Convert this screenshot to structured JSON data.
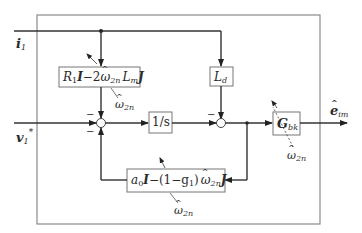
{
  "diagram": {
    "type": "control-block-diagram",
    "inputs": {
      "i1": {
        "symbol": "i",
        "sub": "1"
      },
      "v1star": {
        "symbol": "v",
        "sub": "1",
        "sup": "*"
      }
    },
    "output": {
      "symbol": "e",
      "sub": "im",
      "hat": true
    },
    "blocks": {
      "r1_block": {
        "parts": [
          "R",
          "1",
          "I",
          "−2",
          "ω",
          "2n",
          "L",
          "m",
          "J"
        ],
        "text": "R1I − 2ω̂2n Lm J"
      },
      "ld_block": {
        "symbol": "L",
        "sub": "d",
        "text": "Ld"
      },
      "integrator": {
        "text": "1/s"
      },
      "gbk_block": {
        "symbol": "G",
        "sub": "bk",
        "text": "Gbk"
      },
      "feedback_block": {
        "text": "a0I − (1 − g1) ω̂2n J",
        "a": "a",
        "a_sub": "0",
        "I": "I",
        "mid": "−(1−g",
        "g_sub": "1",
        "close": ")",
        "w": "ω",
        "w_sub": "2n",
        "J": "J"
      }
    },
    "parameter_labels": {
      "omega": "ω",
      "omega_sub": "2n"
    },
    "summing_signs": {
      "sum1_top": "−",
      "sum1_left": "−",
      "sum2_top": "−"
    },
    "colors": {
      "line": "#333333",
      "frame": "#808080",
      "box_border": "#777777"
    }
  }
}
